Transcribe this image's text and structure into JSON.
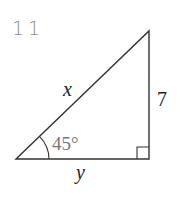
{
  "problem": {
    "number": "11"
  },
  "diagram": {
    "type": "right-triangle",
    "angle_label": "45°",
    "hypotenuse_label": "x",
    "vertical_side_label": "7",
    "base_label": "y",
    "right_angle_marker": true,
    "vertices": {
      "top": [
        149,
        31
      ],
      "bottom_left": [
        16,
        159
      ],
      "bottom_right": [
        149,
        159
      ]
    }
  }
}
